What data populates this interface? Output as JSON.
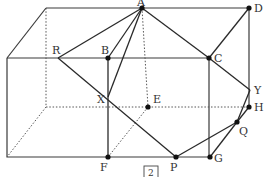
{
  "figure": {
    "caption": "2",
    "labels": {
      "A": "A",
      "B": "B",
      "C": "C",
      "D": "D",
      "E": "E",
      "F": "F",
      "G": "G",
      "H": "H",
      "P": "P",
      "Q": "Q",
      "R": "R",
      "X": "X",
      "Y": "Y"
    },
    "points_marked": [
      "A",
      "B",
      "C",
      "D",
      "E",
      "F",
      "G",
      "H",
      "P",
      "Q"
    ]
  }
}
